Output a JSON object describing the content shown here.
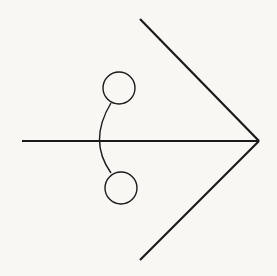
{
  "diagram": {
    "stroke_color": "#1a1a1a",
    "background_color": "#f8f7f4",
    "shaft": {
      "x1": 22,
      "y1": 141,
      "x2": 259,
      "y2": 141
    },
    "upper_line": {
      "x1": 140,
      "y1": 19,
      "x2": 259,
      "y2": 141
    },
    "lower_line": {
      "x1": 140,
      "y1": 260,
      "x2": 259,
      "y2": 141
    },
    "arc": {
      "start": [
        111,
        103
      ],
      "control": [
        88,
        141
      ],
      "end": [
        111,
        173
      ]
    },
    "top_circle": {
      "cx": 119,
      "cy": 88,
      "r": 16
    },
    "bottom_circle": {
      "cx": 121,
      "cy": 188,
      "r": 16
    }
  }
}
